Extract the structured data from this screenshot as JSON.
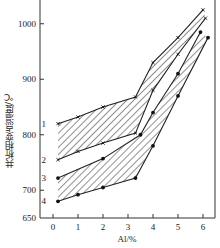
{
  "chart_data": {
    "type": "line",
    "title": "",
    "xlabel": "Al/%",
    "ylabel": "共析相变点温度/℃",
    "xlim": [
      -0.3,
      6.5
    ],
    "ylim": [
      650,
      1060
    ],
    "xticks": [
      0,
      1,
      2,
      3,
      4,
      5,
      6
    ],
    "yticks": [
      650,
      700,
      800,
      900,
      1000
    ],
    "grid": false,
    "legend": "inline numeric labels 1-4 at left of curves",
    "bands": [
      {
        "name": "band A (between curves 1 and 2)",
        "fill": "diagonal hatch"
      },
      {
        "name": "band B (between curves 3 and 4)",
        "fill": "diagonal hatch"
      }
    ],
    "series": [
      {
        "name": "1",
        "marker": "x",
        "x": [
          0.2,
          1.0,
          2.0,
          3.3,
          4.0,
          5.0,
          6.0
        ],
        "y": [
          820,
          832,
          850,
          868,
          930,
          975,
          1025
        ]
      },
      {
        "name": "2",
        "marker": "x",
        "x": [
          0.2,
          1.0,
          2.0,
          3.3,
          4.0,
          5.0,
          6.1
        ],
        "y": [
          755,
          770,
          785,
          803,
          880,
          945,
          1010
        ]
      },
      {
        "name": "3",
        "marker": "dot",
        "x": [
          0.2,
          2.0,
          3.5,
          4.0,
          5.0,
          5.9
        ],
        "y": [
          722,
          757,
          800,
          840,
          910,
          985
        ]
      },
      {
        "name": "4",
        "marker": "dot",
        "x": [
          0.2,
          1.0,
          2.0,
          3.3,
          4.0,
          5.0,
          6.2
        ],
        "y": [
          680,
          692,
          705,
          722,
          780,
          870,
          975
        ]
      }
    ]
  },
  "labels": {
    "ylabel": "共析相变点温度/℃",
    "xlabel": "Al/%",
    "curve_labels": [
      "1",
      "2",
      "3",
      "4"
    ],
    "yticks": [
      "650",
      "700",
      "800",
      "900",
      "1000"
    ],
    "xticks": [
      "0",
      "1",
      "2",
      "3",
      "4",
      "5",
      "6"
    ]
  }
}
